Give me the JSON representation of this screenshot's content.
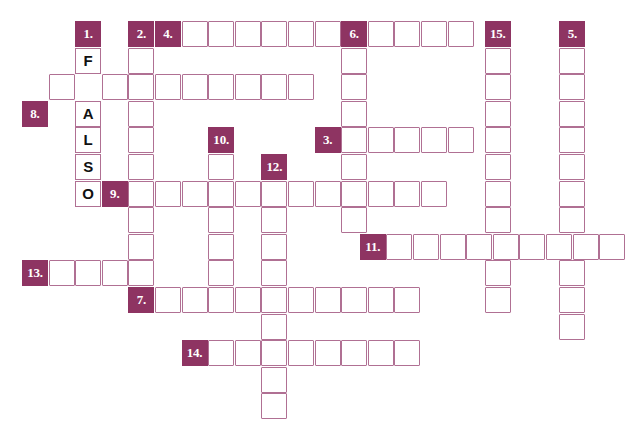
{
  "puzzle": {
    "type": "crossword-grid",
    "title": "",
    "colors": {
      "clue_background": "#8e3462",
      "clue_text": "#ffffff",
      "cell_border": "#b07093",
      "cell_background": "#ffffff",
      "page_background": "#ffffff",
      "letter_text": "#111111"
    },
    "geometry": {
      "origin_x": 22,
      "origin_y": 21,
      "cell_width": 26,
      "cell_height": 26,
      "col_step": 26.6,
      "row_step": 26.6
    },
    "prefilled_word": "FALSO",
    "clue_numbers": [
      "1.",
      "2.",
      "3.",
      "4.",
      "5.",
      "6.",
      "7.",
      "8.",
      "9.",
      "10.",
      "11.",
      "12.",
      "13.",
      "14.",
      "15."
    ],
    "clue_markers": [
      {
        "label": "1.",
        "col": 2,
        "row": 0
      },
      {
        "label": "2.",
        "col": 4,
        "row": 0
      },
      {
        "label": "4.",
        "col": 5,
        "row": 0
      },
      {
        "label": "6.",
        "col": 12,
        "row": 0
      },
      {
        "label": "15.",
        "col": 17.4,
        "row": 0
      },
      {
        "label": "5.",
        "col": 20.2,
        "row": 0
      },
      {
        "label": "8.",
        "col": 0,
        "row": 3
      },
      {
        "label": "10.",
        "col": 7,
        "row": 4
      },
      {
        "label": "3.",
        "col": 11,
        "row": 4
      },
      {
        "label": "12.",
        "col": 9,
        "row": 5
      },
      {
        "label": "9.",
        "col": 3,
        "row": 6
      },
      {
        "label": "11.",
        "col": 12.7,
        "row": 8
      },
      {
        "label": "13.",
        "col": 0,
        "row": 9
      },
      {
        "label": "7.",
        "col": 4,
        "row": 10
      },
      {
        "label": "14.",
        "col": 6,
        "row": 12
      }
    ],
    "letter_cells": [
      {
        "letter": "F",
        "col": 2,
        "row": 1
      },
      {
        "letter": "A",
        "col": 2,
        "row": 3
      },
      {
        "letter": "L",
        "col": 2,
        "row": 4
      },
      {
        "letter": "S",
        "col": 2,
        "row": 5
      },
      {
        "letter": "O",
        "col": 2,
        "row": 6
      }
    ],
    "empty_cells": [
      {
        "col": 6,
        "row": 0
      },
      {
        "col": 7,
        "row": 0
      },
      {
        "col": 8,
        "row": 0
      },
      {
        "col": 9,
        "row": 0
      },
      {
        "col": 10,
        "row": 0
      },
      {
        "col": 11,
        "row": 0
      },
      {
        "col": 13,
        "row": 0
      },
      {
        "col": 14,
        "row": 0
      },
      {
        "col": 15,
        "row": 0
      },
      {
        "col": 16,
        "row": 0
      },
      {
        "col": 4,
        "row": 1
      },
      {
        "col": 12,
        "row": 1
      },
      {
        "col": 17.4,
        "row": 1
      },
      {
        "col": 20.2,
        "row": 1
      },
      {
        "col": 1,
        "row": 2
      },
      {
        "col": 3,
        "row": 2
      },
      {
        "col": 4,
        "row": 2
      },
      {
        "col": 5,
        "row": 2
      },
      {
        "col": 6,
        "row": 2
      },
      {
        "col": 7,
        "row": 2
      },
      {
        "col": 8,
        "row": 2
      },
      {
        "col": 9,
        "row": 2
      },
      {
        "col": 10,
        "row": 2
      },
      {
        "col": 12,
        "row": 2
      },
      {
        "col": 17.4,
        "row": 2
      },
      {
        "col": 20.2,
        "row": 2
      },
      {
        "col": 4,
        "row": 3
      },
      {
        "col": 12,
        "row": 3
      },
      {
        "col": 17.4,
        "row": 3
      },
      {
        "col": 20.2,
        "row": 3
      },
      {
        "col": 4,
        "row": 4
      },
      {
        "col": 12,
        "row": 4
      },
      {
        "col": 13,
        "row": 4
      },
      {
        "col": 14,
        "row": 4
      },
      {
        "col": 15,
        "row": 4
      },
      {
        "col": 16,
        "row": 4
      },
      {
        "col": 17.4,
        "row": 4
      },
      {
        "col": 20.2,
        "row": 4
      },
      {
        "col": 4,
        "row": 5
      },
      {
        "col": 7,
        "row": 5
      },
      {
        "col": 12,
        "row": 5
      },
      {
        "col": 17.4,
        "row": 5
      },
      {
        "col": 20.2,
        "row": 5
      },
      {
        "col": 4,
        "row": 6
      },
      {
        "col": 5,
        "row": 6
      },
      {
        "col": 6,
        "row": 6
      },
      {
        "col": 7,
        "row": 6
      },
      {
        "col": 8,
        "row": 6
      },
      {
        "col": 9,
        "row": 6
      },
      {
        "col": 10,
        "row": 6
      },
      {
        "col": 11,
        "row": 6
      },
      {
        "col": 12,
        "row": 6
      },
      {
        "col": 13,
        "row": 6
      },
      {
        "col": 14,
        "row": 6
      },
      {
        "col": 15,
        "row": 6
      },
      {
        "col": 17.4,
        "row": 6
      },
      {
        "col": 20.2,
        "row": 6
      },
      {
        "col": 4,
        "row": 7
      },
      {
        "col": 7,
        "row": 7
      },
      {
        "col": 9,
        "row": 7
      },
      {
        "col": 12,
        "row": 7
      },
      {
        "col": 17.4,
        "row": 7
      },
      {
        "col": 20.2,
        "row": 7
      },
      {
        "col": 4,
        "row": 8
      },
      {
        "col": 7,
        "row": 8
      },
      {
        "col": 9,
        "row": 8
      },
      {
        "col": 13.7,
        "row": 8
      },
      {
        "col": 14.7,
        "row": 8
      },
      {
        "col": 15.7,
        "row": 8
      },
      {
        "col": 16.7,
        "row": 8
      },
      {
        "col": 17.7,
        "row": 8
      },
      {
        "col": 18.7,
        "row": 8
      },
      {
        "col": 19.7,
        "row": 8
      },
      {
        "col": 20.7,
        "row": 8
      },
      {
        "col": 21.7,
        "row": 8
      },
      {
        "col": 1,
        "row": 9
      },
      {
        "col": 2,
        "row": 9
      },
      {
        "col": 3,
        "row": 9
      },
      {
        "col": 4,
        "row": 9
      },
      {
        "col": 7,
        "row": 9
      },
      {
        "col": 9,
        "row": 9
      },
      {
        "col": 17.4,
        "row": 9
      },
      {
        "col": 20.2,
        "row": 9
      },
      {
        "col": 5,
        "row": 10
      },
      {
        "col": 6,
        "row": 10
      },
      {
        "col": 7,
        "row": 10
      },
      {
        "col": 8,
        "row": 10
      },
      {
        "col": 9,
        "row": 10
      },
      {
        "col": 10,
        "row": 10
      },
      {
        "col": 11,
        "row": 10
      },
      {
        "col": 12,
        "row": 10
      },
      {
        "col": 13,
        "row": 10
      },
      {
        "col": 14,
        "row": 10
      },
      {
        "col": 17.4,
        "row": 10
      },
      {
        "col": 20.2,
        "row": 10
      },
      {
        "col": 9,
        "row": 11
      },
      {
        "col": 20.2,
        "row": 11
      },
      {
        "col": 7,
        "row": 12
      },
      {
        "col": 8,
        "row": 12
      },
      {
        "col": 9,
        "row": 12
      },
      {
        "col": 10,
        "row": 12
      },
      {
        "col": 11,
        "row": 12
      },
      {
        "col": 12,
        "row": 12
      },
      {
        "col": 13,
        "row": 12
      },
      {
        "col": 14,
        "row": 12
      },
      {
        "col": 9,
        "row": 13
      },
      {
        "col": 9,
        "row": 14
      }
    ]
  }
}
